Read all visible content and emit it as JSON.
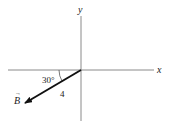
{
  "diagram": {
    "axes": {
      "x_label": "x",
      "y_label": "y",
      "axis_color": "#8a8a8a"
    },
    "vector": {
      "name": "B",
      "label": "B",
      "arrow_symbol": "→",
      "magnitude_label": "4",
      "angle_label": "30°",
      "color": "#111111"
    }
  }
}
